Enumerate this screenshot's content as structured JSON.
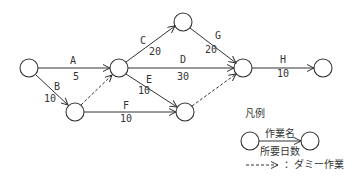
{
  "diagram": {
    "type": "arrow-diagram",
    "activities": [
      {
        "name": "A",
        "days": "5"
      },
      {
        "name": "B",
        "days": "10"
      },
      {
        "name": "C",
        "days": "20"
      },
      {
        "name": "D",
        "days": "30"
      },
      {
        "name": "E",
        "days": "10"
      },
      {
        "name": "F",
        "days": "10"
      },
      {
        "name": "G",
        "days": "20"
      },
      {
        "name": "H",
        "days": "10"
      }
    ],
    "legend": {
      "title": "凡例",
      "activity_name": "作業名",
      "required_days": "所要日数",
      "dummy_label": "：ダミー作業"
    }
  },
  "colors": {
    "line": "#333333",
    "background": "#ffffff"
  }
}
